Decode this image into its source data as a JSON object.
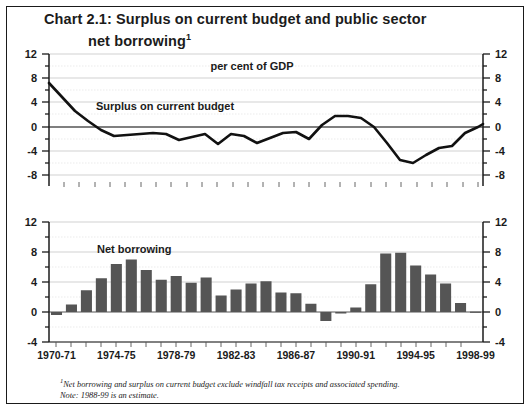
{
  "title": {
    "line1": "Chart 2.1: Surplus on current budget and public sector",
    "line2": "net borrowing",
    "footnote_marker": "1"
  },
  "footnote": {
    "line1_marker": "1",
    "line1": "Net borrowing and surplus on current budget exclude windfall tax receipts and associated spending.",
    "line2": "Note: 1988-99 is an estimate."
  },
  "colors": {
    "line": "#111111",
    "bar": "#555555",
    "axis": "#1b1b1b",
    "grid": "#b8b8b8",
    "zero_line": "#555555",
    "frame": "#1a1a1a",
    "background": "#ffffff"
  },
  "chart_data": [
    {
      "type": "line",
      "title": "Surplus on current budget",
      "annotations": [
        "per cent of GDP",
        "Surplus on current budget"
      ],
      "xlabel": "",
      "ylabel": "per cent of GDP",
      "ylim": [
        -8,
        12
      ],
      "yticks": [
        -8,
        -4,
        0,
        4,
        8,
        12
      ],
      "ytick_labels": [
        "-8",
        "-4",
        "0",
        "4",
        "8",
        "12"
      ],
      "grid": true,
      "legend": "none",
      "x": [
        "1970-71",
        "1971-72",
        "1972-73",
        "1973-74",
        "1974-75",
        "1975-76",
        "1976-77",
        "1977-78",
        "1978-79",
        "1979-80",
        "1980-81",
        "1981-82",
        "1982-83",
        "1983-84",
        "1984-85",
        "1985-86",
        "1986-87",
        "1987-88",
        "1988-89",
        "1989-90",
        "1990-91",
        "1991-92",
        "1992-93",
        "1993-94",
        "1994-95",
        "1995-96",
        "1996-97",
        "1997-98",
        "1998-99"
      ],
      "values": [
        7.2,
        4.6,
        2.6,
        0.9,
        -0.5,
        -1.5,
        -1.4,
        -1.1,
        -1.3,
        -1.3,
        -2.3,
        -1.6,
        -1.1,
        -2.8,
        -1.1,
        -1.4,
        -2.3,
        -1.8,
        -1.0,
        -0.9,
        -1.9,
        0.4,
        1.9,
        1.9,
        1.4,
        0.0,
        -2.6,
        -5.4,
        -5.9,
        -4.6,
        -3.5,
        -3.2,
        -1.0,
        0.2,
        0.7
      ]
    },
    {
      "type": "bar",
      "title": "Net borrowing",
      "annotations": [
        "Net borrowing"
      ],
      "xlabel": "",
      "ylabel": "per cent of GDP",
      "ylim": [
        -4,
        12
      ],
      "yticks": [
        -4,
        0,
        4,
        8,
        12
      ],
      "ytick_labels": [
        "-4",
        "0",
        "4",
        "8",
        "12"
      ],
      "grid": true,
      "legend": "none",
      "categories": [
        "1970-71",
        "1971-72",
        "1972-73",
        "1973-74",
        "1974-75",
        "1975-76",
        "1976-77",
        "1977-78",
        "1978-79",
        "1979-80",
        "1980-81",
        "1981-82",
        "1982-83",
        "1983-84",
        "1984-85",
        "1985-86",
        "1986-87",
        "1987-88",
        "1988-89",
        "1989-90",
        "1990-91",
        "1991-92",
        "1992-93",
        "1993-94",
        "1994-95",
        "1995-96",
        "1996-97",
        "1997-98",
        "1998-99"
      ],
      "xtick_labels": [
        "1970-71",
        "1974-75",
        "1978-79",
        "1982-83",
        "1986-87",
        "1990-91",
        "1994-95",
        "1998-99"
      ],
      "xtick_indices": [
        0,
        4,
        8,
        12,
        16,
        20,
        24,
        28
      ],
      "values": [
        -0.4,
        1.0,
        2.9,
        4.5,
        6.4,
        7.0,
        5.6,
        4.3,
        4.8,
        3.9,
        4.6,
        2.2,
        3.0,
        3.8,
        4.1,
        2.6,
        2.5,
        1.1,
        -1.2,
        -0.2,
        0.6,
        3.7,
        7.8,
        7.9,
        6.2,
        5.0,
        3.8,
        1.2,
        0.05
      ]
    }
  ]
}
